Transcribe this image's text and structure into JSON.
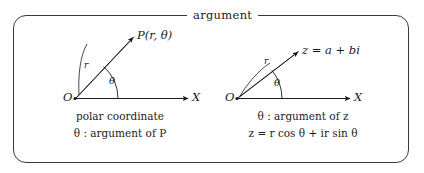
{
  "figure": {
    "title": "argument",
    "background_color": "#ffffff",
    "ink_color": "#1a1a1a",
    "frame_color": "#3a3a3a"
  },
  "left_diagram": {
    "name": "polar-coordinate-diagram",
    "origin_label": "O",
    "axis_label": "X",
    "radius_label": "r",
    "angle_label": "θ",
    "point_label": "P(r, θ)",
    "caption_line1": "polar coordinate",
    "caption_line2": "θ : argument of P"
  },
  "right_diagram": {
    "name": "complex-argument-diagram",
    "origin_label": "O",
    "axis_label": "X",
    "radius_label": "r",
    "angle_label": "θ",
    "point_label": "z = a + bi",
    "caption_line1": "θ : argument of z",
    "caption_line2": "z = r cos θ + ir sin θ"
  }
}
